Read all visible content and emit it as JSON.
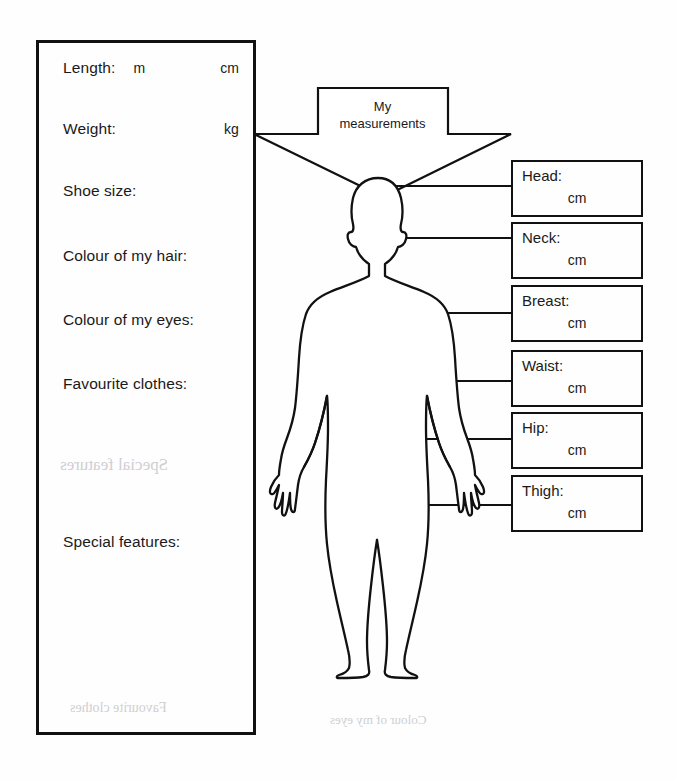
{
  "worksheet": {
    "title": "My measurements",
    "banner": {
      "line1": "My",
      "line2": "measurements"
    },
    "details_panel": {
      "rows": [
        {
          "label": "Length:",
          "unit_a": "m",
          "unit_b": "cm",
          "top": 16
        },
        {
          "label": "Weight:",
          "unit_a": "",
          "unit_b": "kg",
          "top": 77
        },
        {
          "label": "Shoe size:",
          "unit_a": "",
          "unit_b": "",
          "top": 139
        },
        {
          "label": "Colour of my hair:",
          "unit_a": "",
          "unit_b": "",
          "top": 204
        },
        {
          "label": "Colour of my eyes:",
          "unit_a": "",
          "unit_b": "",
          "top": 268
        },
        {
          "label": "Favourite clothes:",
          "unit_a": "",
          "unit_b": "",
          "top": 332
        },
        {
          "label": "Special features:",
          "unit_a": "",
          "unit_b": "",
          "top": 490
        }
      ]
    },
    "measurements": {
      "unit": "cm",
      "boxes": [
        {
          "label": "Head:",
          "unit": "cm",
          "top": 160
        },
        {
          "label": "Neck:",
          "unit": "cm",
          "top": 222
        },
        {
          "label": "Breast:",
          "unit": "cm",
          "top": 285
        },
        {
          "label": "Waist:",
          "unit": "cm",
          "top": 350
        },
        {
          "label": "Hip:",
          "unit": "cm",
          "top": 412
        },
        {
          "label": "Thigh:",
          "unit": "cm",
          "top": 475
        }
      ]
    },
    "ghost_text": [
      {
        "text": "Special features",
        "left": 60,
        "top": 455,
        "size": 17
      },
      {
        "text": "Favourite clothes",
        "left": 70,
        "top": 700,
        "size": 14
      },
      {
        "text": "Colour of my eyes",
        "left": 330,
        "top": 712,
        "size": 13
      }
    ],
    "colors": {
      "ink": "#111111",
      "paper": "#fefefe",
      "ghost": "#cfcfd3"
    }
  }
}
